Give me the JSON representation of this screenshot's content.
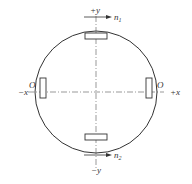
{
  "diagram": {
    "type": "circular cross-section with four sensors",
    "colors": {
      "stroke": "#333333",
      "background": "#ffffff"
    },
    "axes": {
      "plus_y": "+y",
      "minus_y": "−y",
      "plus_x": "+x",
      "minus_x": "−x"
    },
    "origin_left": "O",
    "origin_right": "O",
    "arrows": {
      "top": {
        "label": "n",
        "subscript": "1"
      },
      "bottom": {
        "label": "n",
        "subscript": "2"
      }
    },
    "sensors": [
      {
        "position": "top",
        "orientation": "horizontal"
      },
      {
        "position": "bottom",
        "orientation": "horizontal"
      },
      {
        "position": "left",
        "orientation": "vertical"
      },
      {
        "position": "right",
        "orientation": "vertical"
      }
    ]
  }
}
